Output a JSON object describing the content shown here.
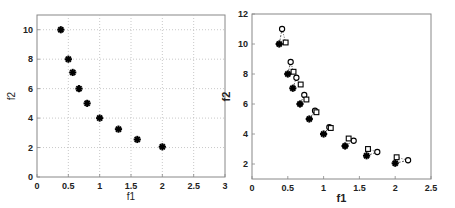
{
  "chart_data": [
    {
      "type": "scatter",
      "title": "",
      "xlabel": "f1",
      "ylabel": "f2",
      "xlim": [
        0,
        3
      ],
      "ylim": [
        0,
        11
      ],
      "xticks": [
        "0",
        "0.5",
        "1",
        "1.5",
        "2",
        "2.5",
        "3"
      ],
      "yticks": [
        "0",
        "2",
        "4",
        "6",
        "8",
        "10"
      ],
      "grid": true,
      "series": [
        {
          "name": "pareto-points",
          "marker": "asterisk",
          "points": [
            [
              0.38,
              10
            ],
            [
              0.5,
              8
            ],
            [
              0.57,
              7.1
            ],
            [
              0.67,
              6
            ],
            [
              0.8,
              5
            ],
            [
              1.0,
              4
            ],
            [
              1.3,
              3.25
            ],
            [
              1.6,
              2.55
            ],
            [
              2.0,
              2.05
            ]
          ]
        }
      ]
    },
    {
      "type": "scatter",
      "title": "",
      "xlabel": "f1",
      "ylabel": "f2",
      "xlim": [
        0,
        2.5
      ],
      "ylim": [
        1,
        12
      ],
      "xticks": [
        "0",
        "0.5",
        "1",
        "1.5",
        "2",
        "2.5"
      ],
      "yticks": [
        "2",
        "4",
        "6",
        "8",
        "10",
        "12"
      ],
      "grid": false,
      "series": [
        {
          "name": "original",
          "marker": "asterisk",
          "points": [
            [
              0.38,
              10
            ],
            [
              0.5,
              8
            ],
            [
              0.57,
              7.05
            ],
            [
              0.67,
              6
            ],
            [
              0.8,
              5
            ],
            [
              1.0,
              4
            ],
            [
              1.3,
              3.2
            ],
            [
              1.6,
              2.55
            ],
            [
              2.0,
              2.05
            ]
          ]
        },
        {
          "name": "circle",
          "marker": "circle",
          "points": [
            [
              0.42,
              11.0
            ],
            [
              0.54,
              8.8
            ],
            [
              0.62,
              7.75
            ],
            [
              0.73,
              6.6
            ],
            [
              0.88,
              5.55
            ],
            [
              1.08,
              4.45
            ],
            [
              1.42,
              3.55
            ],
            [
              1.75,
              2.8
            ],
            [
              2.18,
              2.25
            ]
          ]
        },
        {
          "name": "square",
          "marker": "square",
          "points": [
            [
              0.47,
              10.1
            ],
            [
              0.58,
              8.15
            ],
            [
              0.68,
              7.3
            ],
            [
              0.76,
              6.3
            ],
            [
              0.9,
              5.45
            ],
            [
              1.1,
              4.4
            ],
            [
              1.35,
              3.7
            ],
            [
              1.62,
              3.0
            ],
            [
              2.02,
              2.45
            ]
          ]
        }
      ]
    }
  ]
}
